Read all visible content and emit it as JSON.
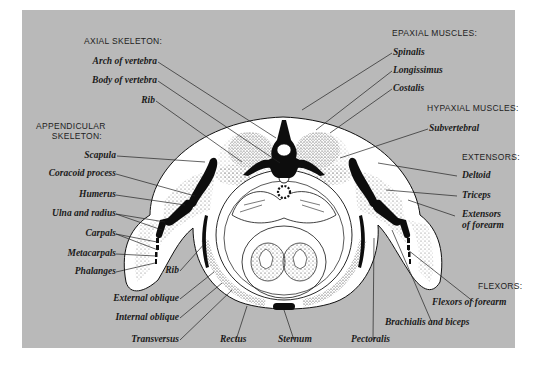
{
  "figure": {
    "background_color": "#b9b9b9",
    "groups": {
      "axial_skeleton": {
        "heading": "AXIAL SKELETON:",
        "labels": [
          "Arch of vertebra",
          "Body of vertebra",
          "Rib"
        ]
      },
      "appendicular_skeleton": {
        "heading_line1": "APPENDICULAR",
        "heading_line2": "SKELETON:",
        "labels": [
          "Scapula",
          "Coracoid process",
          "Humerus",
          "Ulna and radius",
          "Carpals",
          "Metacarpals",
          "Phalanges"
        ]
      },
      "epaxial_muscles": {
        "heading": "EPAXIAL MUSCLES:",
        "labels": [
          "Spinalis",
          "Longissimus",
          "Costalis"
        ]
      },
      "hypaxial_muscles": {
        "heading": "HYPAXIAL MUSCLES:",
        "labels": [
          "Subvertebral"
        ]
      },
      "extensors": {
        "heading": "EXTENSORS:",
        "labels": [
          "Deltoid",
          "Triceps",
          "Extensors",
          "of forearm"
        ]
      },
      "flexors": {
        "heading": "FLEXORS:",
        "labels": [
          "Flexors of forearm"
        ]
      },
      "bottom_left": {
        "labels": [
          "Rib",
          "External oblique",
          "Internal oblique",
          "Transversus",
          "Rectus"
        ]
      },
      "bottom_right": {
        "labels": [
          "Sternum",
          "Pectoralis",
          "Brachialis and biceps"
        ]
      }
    }
  }
}
